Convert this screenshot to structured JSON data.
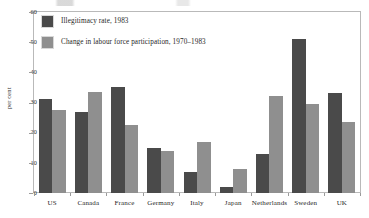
{
  "chart_data": {
    "type": "bar",
    "title": "",
    "xlabel": "",
    "ylabel": "per cent",
    "ylim": [
      0,
      60
    ],
    "yticks": [
      "0",
      "10",
      "20",
      "30",
      "40",
      "50",
      "60"
    ],
    "grid": false,
    "legend_position": "top-left",
    "categories": [
      "US",
      "Canada",
      "France",
      "Germany",
      "Italy",
      "Japan",
      "Netherlands",
      "Sweden",
      "UK"
    ],
    "series": [
      {
        "name": "Illegitimacy rate, 1983",
        "color": "#4a4a4a",
        "values": [
          31,
          27,
          35,
          15,
          7,
          2,
          13,
          51,
          33
        ]
      },
      {
        "name": "Change in labour force participation, 1970–1983",
        "color": "#8f8f8f",
        "values": [
          27.5,
          33.5,
          22.5,
          14,
          17,
          8,
          32,
          29.5,
          23.5
        ]
      }
    ]
  },
  "legend": {
    "entries": [
      "Illegitimacy rate, 1983",
      "Change in labour force participation, 1970–1983"
    ]
  },
  "axes": {
    "y_label": "per cent",
    "y_ticks": [
      "60",
      "50",
      "40",
      "30",
      "20",
      "10",
      "0"
    ],
    "x_ticks": [
      "US",
      "Canada",
      "France",
      "Germany",
      "Italy",
      "Japan",
      "Netherlands",
      "Sweden",
      "UK"
    ]
  }
}
